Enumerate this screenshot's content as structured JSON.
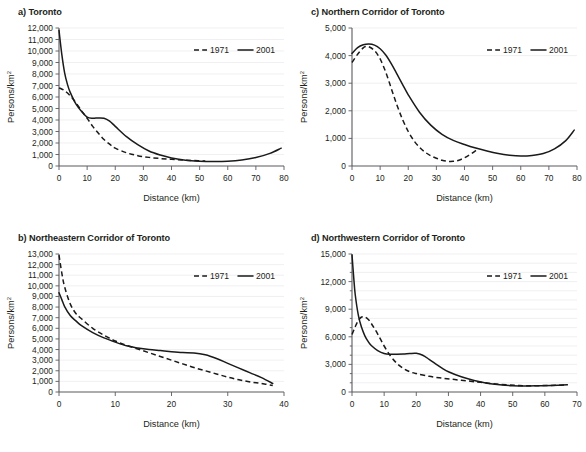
{
  "figure": {
    "ghost_caption": "",
    "axis_x_title": "Distance (km)",
    "axis_y_title": "Persons/km",
    "axis_y_title_sup": "2",
    "legend": {
      "dashed_label": "1971",
      "solid_label": "2001"
    },
    "colors": {
      "ink": "#231f20",
      "series": "#1a1a1a",
      "grid": "#e9e9ec",
      "axis": "#5a5a5f"
    }
  },
  "chart_data": [
    {
      "id": "a",
      "type": "line",
      "title": "a) Toronto",
      "xlabel": "Distance (km)",
      "ylabel": "Persons/km2",
      "xlim": [
        0,
        80
      ],
      "ylim": [
        0,
        12000
      ],
      "xticks": [
        0,
        10,
        20,
        30,
        40,
        50,
        60,
        70,
        80
      ],
      "yticks": [
        0,
        1000,
        2000,
        3000,
        4000,
        5000,
        6000,
        7000,
        8000,
        9000,
        10000,
        11000,
        12000
      ],
      "ytick_labels": [
        "0",
        "1,000",
        "2,000",
        "3,000",
        "4,000",
        "5,000",
        "6,000",
        "7,000",
        "8,000",
        "9,000",
        "10,000",
        "11,000",
        "12,000"
      ],
      "xtick_labels": [
        "0",
        "10",
        "20",
        "30",
        "40",
        "50",
        "60",
        "70",
        "80"
      ],
      "grid": true,
      "legend_position": "top-right",
      "series": [
        {
          "name": "1971",
          "style": "dashed",
          "x": [
            0,
            2,
            4,
            6,
            8,
            10,
            12,
            14,
            16,
            18,
            20,
            24,
            28,
            32,
            36,
            40,
            44,
            48,
            52
          ],
          "y": [
            6800,
            6550,
            6100,
            5500,
            4800,
            4150,
            3450,
            2850,
            2300,
            1900,
            1550,
            1150,
            900,
            750,
            650,
            580,
            520,
            470,
            430
          ]
        },
        {
          "name": "2001",
          "style": "solid",
          "x": [
            0,
            1,
            2,
            3,
            4,
            6,
            8,
            10,
            12,
            14,
            16,
            18,
            20,
            24,
            28,
            32,
            36,
            40,
            45,
            50,
            55,
            60,
            65,
            70,
            75,
            79
          ],
          "y": [
            11800,
            9700,
            8100,
            7100,
            6400,
            5400,
            4750,
            4250,
            4150,
            4180,
            4150,
            3900,
            3450,
            2550,
            1850,
            1300,
            950,
            700,
            500,
            420,
            400,
            420,
            520,
            730,
            1100,
            1550
          ]
        }
      ]
    },
    {
      "id": "b",
      "type": "line",
      "title": "b) Northeastern Corridor of Toronto",
      "xlabel": "Distance (km)",
      "ylabel": "Persons/km2",
      "xlim": [
        0,
        40
      ],
      "ylim": [
        0,
        13000
      ],
      "xticks": [
        0,
        10,
        20,
        30,
        40
      ],
      "yticks": [
        0,
        1000,
        2000,
        3000,
        4000,
        5000,
        6000,
        7000,
        8000,
        9000,
        10000,
        11000,
        12000,
        13000
      ],
      "ytick_labels": [
        "0",
        "1,000",
        "2,000",
        "3,000",
        "4,000",
        "5,000",
        "6,000",
        "7,000",
        "8,000",
        "9,000",
        "10,000",
        "11,000",
        "12,000",
        "13,000"
      ],
      "xtick_labels": [
        "0",
        "10",
        "20",
        "30",
        "40"
      ],
      "grid": true,
      "legend_position": "top-right",
      "series": [
        {
          "name": "1971",
          "style": "dashed",
          "x": [
            0,
            0.5,
            1,
            2,
            3,
            4,
            6,
            8,
            10,
            12,
            14,
            16,
            18,
            20,
            22,
            24,
            26,
            28,
            30,
            32,
            34,
            36,
            38
          ],
          "y": [
            12900,
            11200,
            9900,
            8300,
            7400,
            6900,
            6000,
            5350,
            4800,
            4400,
            4050,
            3700,
            3350,
            3000,
            2650,
            2300,
            2000,
            1700,
            1400,
            1150,
            950,
            800,
            620
          ]
        },
        {
          "name": "2001",
          "style": "solid",
          "x": [
            0,
            0.5,
            1,
            2,
            3,
            4,
            6,
            8,
            10,
            12,
            14,
            16,
            18,
            20,
            22,
            24,
            26,
            28,
            30,
            32,
            34,
            36,
            38
          ],
          "y": [
            9350,
            8700,
            8050,
            7200,
            6700,
            6250,
            5600,
            5100,
            4700,
            4350,
            4150,
            4000,
            3900,
            3800,
            3720,
            3680,
            3500,
            3150,
            2700,
            2250,
            1800,
            1350,
            800
          ]
        }
      ]
    },
    {
      "id": "c",
      "type": "line",
      "title": "c) Northern Corridor of Toronto",
      "xlabel": "Distance (km)",
      "ylabel": "Persons/km2",
      "xlim": [
        0,
        80
      ],
      "ylim": [
        0,
        5000
      ],
      "xticks": [
        0,
        10,
        20,
        30,
        40,
        50,
        60,
        70,
        80
      ],
      "yticks": [
        0,
        1000,
        2000,
        3000,
        4000,
        5000
      ],
      "ytick_labels": [
        "0",
        "1,000",
        "2,000",
        "3,000",
        "4,000",
        "5,000"
      ],
      "xtick_labels": [
        "0",
        "10",
        "20",
        "30",
        "40",
        "50",
        "60",
        "70",
        "80"
      ],
      "grid": true,
      "legend_position": "top-right",
      "series": [
        {
          "name": "1971",
          "style": "dashed",
          "x": [
            0,
            2,
            4,
            5,
            6,
            8,
            10,
            12,
            14,
            16,
            18,
            20,
            22,
            24,
            26,
            28,
            30,
            32,
            34,
            36,
            38,
            40,
            42,
            44,
            45
          ],
          "y": [
            3750,
            4050,
            4280,
            4330,
            4320,
            4180,
            3880,
            3400,
            2800,
            2200,
            1680,
            1250,
            920,
            680,
            500,
            370,
            280,
            210,
            170,
            170,
            210,
            300,
            420,
            560,
            640
          ]
        },
        {
          "name": "2001",
          "style": "solid",
          "x": [
            0,
            2,
            4,
            6,
            8,
            10,
            12,
            14,
            16,
            18,
            20,
            24,
            28,
            32,
            36,
            40,
            44,
            48,
            52,
            56,
            60,
            64,
            68,
            72,
            76,
            79
          ],
          "y": [
            4080,
            4290,
            4390,
            4420,
            4380,
            4250,
            4020,
            3700,
            3330,
            2950,
            2580,
            1950,
            1480,
            1150,
            930,
            780,
            650,
            540,
            450,
            390,
            360,
            380,
            450,
            620,
            920,
            1300
          ]
        }
      ]
    },
    {
      "id": "d",
      "type": "line",
      "title": "d) Northwestern Corridor of Toronto",
      "xlabel": "Distance (km)",
      "ylabel": "Persons/km2",
      "xlim": [
        0,
        70
      ],
      "ylim": [
        0,
        15000
      ],
      "xticks": [
        0,
        10,
        20,
        30,
        40,
        50,
        60,
        70
      ],
      "yticks": [
        0,
        3000,
        6000,
        9000,
        12000,
        15000
      ],
      "ytick_labels": [
        "0",
        "3,000",
        "6,000",
        "9,000",
        "12,000",
        "15,000"
      ],
      "minor_yticks": [
        1000,
        2000,
        4000,
        5000,
        7000,
        8000,
        10000,
        11000,
        13000,
        14000
      ],
      "xtick_labels": [
        "0",
        "10",
        "20",
        "30",
        "40",
        "50",
        "60",
        "70"
      ],
      "grid": true,
      "legend_position": "top-right",
      "series": [
        {
          "name": "1971",
          "style": "dashed",
          "x": [
            0,
            1,
            2,
            3,
            4,
            5,
            6,
            8,
            10,
            12,
            14,
            16,
            18,
            20,
            24,
            28,
            32,
            36,
            40,
            44,
            48,
            52,
            56,
            60,
            64,
            67
          ],
          "y": [
            6250,
            7100,
            7800,
            8150,
            8150,
            7900,
            7450,
            6300,
            5000,
            3900,
            3100,
            2550,
            2200,
            2000,
            1700,
            1500,
            1350,
            1200,
            1050,
            900,
            780,
            700,
            680,
            700,
            730,
            760
          ]
        },
        {
          "name": "2001",
          "style": "solid",
          "x": [
            0,
            0.5,
            1,
            2,
            3,
            4,
            5,
            6,
            8,
            10,
            12,
            14,
            16,
            18,
            20,
            22,
            24,
            26,
            28,
            30,
            34,
            38,
            42,
            46,
            50,
            54,
            58,
            62,
            67
          ],
          "y": [
            14900,
            12600,
            10600,
            8300,
            7000,
            6100,
            5500,
            5050,
            4500,
            4180,
            4100,
            4100,
            4120,
            4180,
            4200,
            4000,
            3550,
            3050,
            2600,
            2200,
            1650,
            1250,
            950,
            780,
            680,
            650,
            680,
            720,
            780
          ]
        }
      ]
    }
  ]
}
